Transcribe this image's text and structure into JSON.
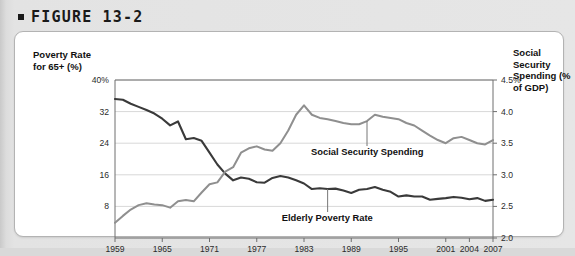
{
  "figure": {
    "bullet_icon": "square-bullet-icon",
    "title": "FIGURE 13-2"
  },
  "axes": {
    "left_title": "Poverty Rate for 65+ (%)",
    "right_title": "Social Security Spending (% of GDP)",
    "left_ticks": [
      "40%",
      "32",
      "24",
      "16",
      "8"
    ],
    "right_ticks": [
      "4.5%",
      "4.0",
      "3.5",
      "3.0",
      "2.5",
      "2.0"
    ],
    "x_ticks": [
      "1959",
      "1965",
      "1971",
      "1977",
      "1983",
      "1989",
      "1995",
      "2001",
      "2004",
      "2007"
    ]
  },
  "colors": {
    "poverty_line": "#3a3a3a",
    "spending_line": "#8f8f8f",
    "gridline": "#d8d8d8",
    "axis": "#6e6e6e",
    "card_background": "#ffffff",
    "page_background": "#e6e6e6"
  },
  "chart_data": {
    "type": "line",
    "title": "FIGURE 13-2",
    "xlabel": "",
    "ylabel": "Poverty Rate for 65+ (%)",
    "y2label": "Social Security Spending (% of GDP)",
    "xlim": [
      1959,
      2007
    ],
    "ylim": [
      0,
      40
    ],
    "y2lim": [
      2.0,
      4.5
    ],
    "ytick_values": [
      8,
      16,
      24,
      32,
      40
    ],
    "y2tick_values": [
      2.0,
      2.5,
      3.0,
      3.5,
      4.0,
      4.5
    ],
    "xtick_values": [
      1959,
      1965,
      1971,
      1977,
      1983,
      1989,
      1995,
      2001,
      2004,
      2007
    ],
    "grid": true,
    "legend": "inline-annotations",
    "annotations": [
      {
        "text": "Social Security Spending",
        "year": 1991,
        "axis": "right"
      },
      {
        "text": "Elderly Poverty Rate",
        "year": 1986,
        "axis": "left"
      }
    ],
    "series": [
      {
        "name": "Elderly Poverty Rate",
        "axis": "left",
        "unit": "%",
        "color": "#3a3a3a",
        "x": [
          1959,
          1960,
          1961,
          1962,
          1963,
          1964,
          1965,
          1966,
          1967,
          1968,
          1969,
          1970,
          1971,
          1972,
          1973,
          1974,
          1975,
          1976,
          1977,
          1978,
          1979,
          1980,
          1981,
          1982,
          1983,
          1984,
          1985,
          1986,
          1987,
          1988,
          1989,
          1990,
          1991,
          1992,
          1993,
          1994,
          1995,
          1996,
          1997,
          1998,
          1999,
          2000,
          2001,
          2002,
          2003,
          2004,
          2005,
          2006,
          2007
        ],
        "y": [
          35.2,
          35.0,
          34.0,
          33.2,
          32.4,
          31.5,
          30.2,
          28.5,
          29.5,
          25.0,
          25.3,
          24.6,
          21.6,
          18.6,
          16.3,
          14.6,
          15.3,
          15.0,
          14.1,
          14.0,
          15.2,
          15.7,
          15.3,
          14.6,
          13.8,
          12.4,
          12.6,
          12.4,
          12.5,
          12.0,
          11.4,
          12.2,
          12.4,
          12.9,
          12.2,
          11.7,
          10.5,
          10.8,
          10.5,
          10.5,
          9.7,
          9.9,
          10.1,
          10.4,
          10.2,
          9.8,
          10.1,
          9.4,
          9.7
        ]
      },
      {
        "name": "Social Security Spending",
        "axis": "right",
        "unit": "% of GDP",
        "color": "#8f8f8f",
        "x": [
          1959,
          1960,
          1961,
          1962,
          1963,
          1964,
          1965,
          1966,
          1967,
          1968,
          1969,
          1970,
          1971,
          1972,
          1973,
          1974,
          1975,
          1976,
          1977,
          1978,
          1979,
          1980,
          1981,
          1982,
          1983,
          1984,
          1985,
          1986,
          1987,
          1988,
          1989,
          1990,
          1991,
          1992,
          1993,
          1994,
          1995,
          1996,
          1997,
          1998,
          1999,
          2000,
          2001,
          2002,
          2003,
          2004,
          2005,
          2006,
          2007
        ],
        "y": [
          2.24,
          2.35,
          2.45,
          2.52,
          2.55,
          2.53,
          2.52,
          2.48,
          2.58,
          2.6,
          2.58,
          2.72,
          2.85,
          2.88,
          3.05,
          3.12,
          3.35,
          3.42,
          3.45,
          3.4,
          3.38,
          3.5,
          3.7,
          3.95,
          4.1,
          3.95,
          3.9,
          3.88,
          3.85,
          3.82,
          3.8,
          3.8,
          3.85,
          3.95,
          3.92,
          3.9,
          3.88,
          3.82,
          3.78,
          3.7,
          3.62,
          3.55,
          3.5,
          3.58,
          3.6,
          3.55,
          3.5,
          3.48,
          3.55
        ]
      }
    ]
  }
}
